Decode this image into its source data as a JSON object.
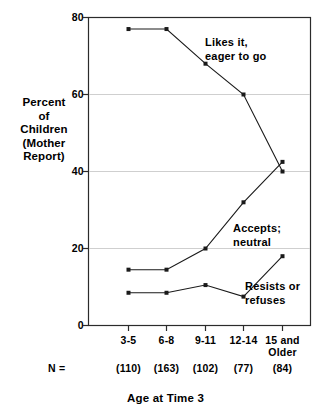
{
  "chart_data": {
    "type": "line",
    "title": "",
    "xlabel": "Age at Time 3",
    "ylabel": "Percent of Children (Mother Report)",
    "categories": [
      "3-5",
      "6-8",
      "9-11",
      "12-14",
      "15 and Older"
    ],
    "ylim": [
      0,
      80
    ],
    "yticks": [
      0,
      20,
      40,
      60,
      80
    ],
    "grid": true,
    "legend_position": "inline-annotations",
    "n_label": "N =",
    "n_values": [
      "(110)",
      "(163)",
      "(102)",
      "(77)",
      "(84)"
    ],
    "series": [
      {
        "name": "Likes it, eager to go",
        "values": [
          77,
          77,
          68,
          60,
          40
        ],
        "annotation": [
          "Likes it,",
          "eager to go"
        ]
      },
      {
        "name": "Accepts; neutral",
        "values": [
          14.5,
          14.5,
          20,
          32,
          42.5
        ],
        "annotation": [
          "Accepts;",
          "neutral"
        ]
      },
      {
        "name": "Resists or refuses",
        "values": [
          8.5,
          8.5,
          10.5,
          7.5,
          18
        ],
        "annotation": [
          "Resists or",
          "refuses"
        ]
      }
    ]
  },
  "axis": {
    "y_title_lines": [
      "Percent",
      "of",
      "Children",
      "(Mother",
      "Report)"
    ],
    "y_tick_labels": [
      "80",
      "60",
      "40",
      "20",
      "0"
    ],
    "x_tick_labels": [
      [
        "3-5"
      ],
      [
        "6-8"
      ],
      [
        "9-11"
      ],
      [
        "12-14"
      ],
      [
        "15 and",
        "Older"
      ]
    ],
    "x_title": "Age at Time 3"
  },
  "colors": {
    "line": "#1a1a1a",
    "frame": "#2b2b2b",
    "grid": "#cfcfcf",
    "background": "#ffffff",
    "text": "#000000"
  }
}
